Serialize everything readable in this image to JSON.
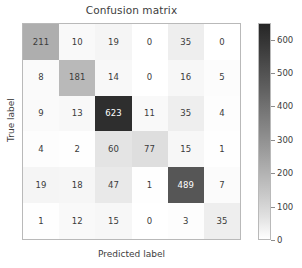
{
  "chart_data": {
    "type": "heatmap",
    "title": "Confusion matrix",
    "xlabel": "Predicted label",
    "ylabel": "True label",
    "rows": 6,
    "columns": 6,
    "matrix": [
      [
        211,
        10,
        19,
        0,
        35,
        0
      ],
      [
        8,
        181,
        14,
        0,
        16,
        5
      ],
      [
        9,
        13,
        623,
        11,
        35,
        4
      ],
      [
        4,
        2,
        60,
        77,
        15,
        1
      ],
      [
        19,
        18,
        47,
        1,
        489,
        7
      ],
      [
        1,
        12,
        15,
        0,
        3,
        35
      ]
    ],
    "colormap": "Greys",
    "colorbar": {
      "position": "right",
      "vmin": 0,
      "vmax": 650,
      "ticks": [
        0,
        100,
        200,
        300,
        400,
        500,
        600
      ],
      "tick_labels": [
        "0",
        "100",
        "200",
        "300",
        "400",
        "500",
        "600"
      ],
      "low_color": "#ffffff",
      "high_color": "#262626"
    },
    "grid": false,
    "xticks": [],
    "yticks": [],
    "text_color_dark": "#3b3b3b",
    "text_color_light": "#ffffff",
    "text_threshold": 325
  }
}
